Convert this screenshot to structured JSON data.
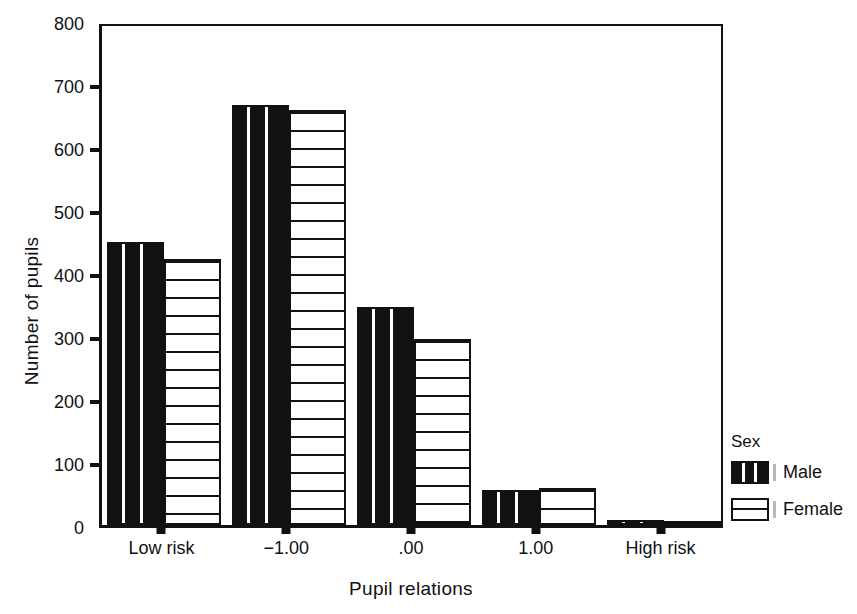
{
  "chart_data": {
    "type": "bar",
    "title": "",
    "subtitle": "",
    "xlabel": "Pupil relations",
    "ylabel": "Number of pupils",
    "categories": [
      "Low risk",
      "−1.00",
      ".00",
      "1.00",
      "High risk"
    ],
    "series": [
      {
        "name": "Male",
        "values": [
          449,
          667,
          346,
          56,
          8
        ]
      },
      {
        "name": "Female",
        "values": [
          422,
          659,
          295,
          58,
          7
        ]
      }
    ],
    "ylim": [
      0,
      800
    ],
    "yticks": [
      0,
      100,
      200,
      300,
      400,
      500,
      600,
      700,
      800
    ],
    "ytick_labels": [
      "0",
      "100",
      "200",
      "300",
      "400",
      "500",
      "600",
      "700",
      "800"
    ],
    "grid": false,
    "legend": {
      "title": "Sex",
      "position": "right",
      "entries": [
        {
          "label": "Male",
          "pattern": "vertical-stripes-on-black",
          "color": "#111111"
        },
        {
          "label": "Female",
          "pattern": "horizontal-lines-on-white",
          "color": "#ffffff"
        }
      ]
    },
    "axis_color": "#111111",
    "background": "#ffffff"
  }
}
